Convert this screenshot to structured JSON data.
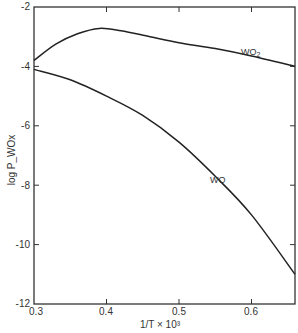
{
  "chart_data": {
    "type": "line",
    "title": "",
    "xlabel": "1/T × 10³",
    "ylabel": "log P_WOx",
    "xlim": [
      0.3,
      0.66
    ],
    "ylim": [
      -12,
      -2
    ],
    "grid": false,
    "legend": "inline labels",
    "x_ticks": [
      "0.3",
      "0.4",
      "0.5",
      "0.6"
    ],
    "y_ticks": [
      "-2",
      "-4",
      "-6",
      "-8",
      "-10",
      "-12"
    ],
    "series": [
      {
        "name": "WO2",
        "label": "WO",
        "label_sub": "2",
        "x": [
          0.3,
          0.33,
          0.36,
          0.39,
          0.42,
          0.46,
          0.5,
          0.55,
          0.6,
          0.66
        ],
        "y": [
          -3.8,
          -3.25,
          -2.9,
          -2.72,
          -2.8,
          -3.0,
          -3.2,
          -3.4,
          -3.65,
          -4.0
        ]
      },
      {
        "name": "WO",
        "label": "WO",
        "x": [
          0.3,
          0.35,
          0.4,
          0.45,
          0.5,
          0.55,
          0.6,
          0.66
        ],
        "y": [
          -4.1,
          -4.45,
          -5.0,
          -5.65,
          -6.55,
          -7.7,
          -9.0,
          -11.0
        ]
      }
    ]
  }
}
